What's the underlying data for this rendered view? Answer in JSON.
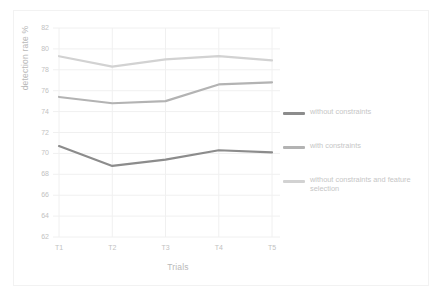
{
  "chart_data": {
    "type": "line",
    "title": "",
    "xlabel": "Trials",
    "ylabel": "detection rate %",
    "categories": [
      "T1",
      "T2",
      "T3",
      "T4",
      "T5"
    ],
    "ylim": [
      62,
      82
    ],
    "yticks": [
      62,
      64,
      66,
      68,
      70,
      72,
      74,
      76,
      78,
      80,
      82
    ],
    "grid": "horizontal-and-vertical",
    "legend_position": "right",
    "series": [
      {
        "name": "without constraints",
        "color": "#8c8c8c",
        "values": [
          70.7,
          68.8,
          69.4,
          70.3,
          70.1
        ]
      },
      {
        "name": "with constraints",
        "color": "#b3b3b3",
        "values": [
          75.4,
          74.8,
          75.0,
          76.6,
          76.8
        ]
      },
      {
        "name": "without constraints and feature selection",
        "color": "#d2d2d2",
        "values": [
          79.3,
          78.3,
          79.0,
          79.3,
          78.9
        ]
      }
    ]
  },
  "axes": {
    "y_title": "detection rate %",
    "x_title": "Trials",
    "y_tick_labels": [
      "82",
      "80",
      "78",
      "76",
      "74",
      "72",
      "70",
      "68",
      "66",
      "64",
      "62"
    ],
    "x_tick_labels": [
      "T1",
      "T2",
      "T3",
      "T4",
      "T5"
    ]
  },
  "legend": {
    "items": [
      {
        "label": "without constraints",
        "color": "#8c8c8c"
      },
      {
        "label": "with constraints",
        "color": "#b3b3b3"
      },
      {
        "label": "without constraints and feature selection",
        "color": "#d2d2d2"
      }
    ]
  },
  "colors": {
    "grid": "#f0f0f0",
    "tick_text": "#c2c2c2",
    "axis_text": "#b9b9b9",
    "frame": "#f2f2f2",
    "background": "#ffffff"
  }
}
